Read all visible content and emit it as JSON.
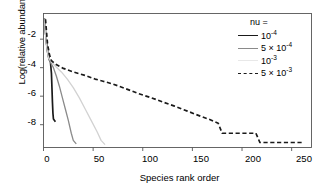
{
  "chart_data": {
    "type": "line",
    "title": "",
    "xlabel": "Species rank order",
    "ylabel": "Log(relative abundance)",
    "xlim": [
      0,
      270
    ],
    "ylim": [
      -9.6,
      -0.2
    ],
    "xticks": [
      0,
      50,
      100,
      150,
      200,
      250
    ],
    "yticks": [
      -2,
      -4,
      -6,
      -8
    ],
    "grid": false,
    "legend_position": "top-right",
    "legend_title": "nu =",
    "series": [
      {
        "name": "10-4",
        "name_base": "10",
        "name_exp": "-4",
        "style": "solid",
        "color": "#1a1a1a",
        "width": 1.7,
        "points": [
          [
            1,
            -0.55
          ],
          [
            2,
            -1.5
          ],
          [
            3,
            -2.25
          ],
          [
            4,
            -2.8
          ],
          [
            5,
            -3.2
          ],
          [
            6,
            -3.45
          ],
          [
            7,
            -3.6
          ],
          [
            8,
            -4.4
          ],
          [
            8.5,
            -5.4
          ],
          [
            9,
            -6.4
          ],
          [
            9.5,
            -7.2
          ],
          [
            10,
            -7.6
          ],
          [
            12,
            -7.8
          ]
        ]
      },
      {
        "name": "5 x 10-4",
        "name_base": "5 × 10",
        "name_exp": "-4",
        "style": "solid",
        "color": "#8a8a8a",
        "width": 1.3,
        "points": [
          [
            1,
            -0.6
          ],
          [
            2,
            -1.6
          ],
          [
            3,
            -2.4
          ],
          [
            4,
            -2.95
          ],
          [
            5,
            -3.3
          ],
          [
            6,
            -3.5
          ],
          [
            8,
            -3.75
          ],
          [
            10,
            -4.0
          ],
          [
            13,
            -4.6
          ],
          [
            16,
            -5.3
          ],
          [
            19,
            -6.1
          ],
          [
            22,
            -6.9
          ],
          [
            25,
            -7.7
          ],
          [
            28,
            -8.6
          ],
          [
            30,
            -9.1
          ],
          [
            33,
            -9.35
          ]
        ]
      },
      {
        "name": "10-3",
        "name_base": "10",
        "name_exp": "-3",
        "style": "solid",
        "color": "#d2d2d2",
        "width": 1.3,
        "points": [
          [
            1,
            -0.6
          ],
          [
            3,
            -2.4
          ],
          [
            5,
            -3.3
          ],
          [
            8,
            -3.6
          ],
          [
            12,
            -3.9
          ],
          [
            18,
            -4.3
          ],
          [
            24,
            -4.8
          ],
          [
            30,
            -5.4
          ],
          [
            36,
            -6.1
          ],
          [
            42,
            -6.9
          ],
          [
            48,
            -7.7
          ],
          [
            54,
            -8.5
          ],
          [
            58,
            -9.1
          ],
          [
            62,
            -9.4
          ]
        ]
      },
      {
        "name": "5 x 10-3",
        "name_base": "5 × 10",
        "name_exp": "-3",
        "style": "dashed",
        "color": "#1a1a1a",
        "width": 1.7,
        "points": [
          [
            2,
            -0.6
          ],
          [
            4,
            -2.3
          ],
          [
            6,
            -3.1
          ],
          [
            8,
            -3.5
          ],
          [
            12,
            -3.75
          ],
          [
            20,
            -4.05
          ],
          [
            30,
            -4.3
          ],
          [
            42,
            -4.55
          ],
          [
            52,
            -4.8
          ],
          [
            60,
            -4.95
          ],
          [
            70,
            -5.15
          ],
          [
            82,
            -5.45
          ],
          [
            95,
            -5.8
          ],
          [
            108,
            -6.1
          ],
          [
            120,
            -6.4
          ],
          [
            132,
            -6.7
          ],
          [
            145,
            -7.05
          ],
          [
            158,
            -7.4
          ],
          [
            168,
            -7.65
          ],
          [
            176,
            -7.9
          ],
          [
            180,
            -8.6
          ],
          [
            214,
            -8.6
          ],
          [
            218,
            -9.25
          ],
          [
            262,
            -9.25
          ]
        ]
      }
    ]
  },
  "axes": {
    "xtick_labels": [
      "0",
      "50",
      "100",
      "150",
      "200",
      "250"
    ],
    "ytick_labels": [
      "-2",
      "-4",
      "-6",
      "-8"
    ]
  }
}
